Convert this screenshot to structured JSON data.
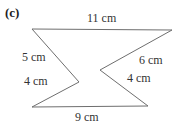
{
  "figure": {
    "part_label": "(c)",
    "shape_name": "zigzag-hexagon",
    "stroke_color": "#6e6e6e",
    "fill_color": "#ffffff",
    "background_color": "#ffffff",
    "vertices": [
      {
        "name": "top-left",
        "x": 32,
        "y": 29
      },
      {
        "name": "top-right",
        "x": 172,
        "y": 30
      },
      {
        "name": "right-notch",
        "x": 100,
        "y": 70
      },
      {
        "name": "bottom-right",
        "x": 148,
        "y": 106
      },
      {
        "name": "bottom-left",
        "x": 32,
        "y": 107
      },
      {
        "name": "left-notch",
        "x": 79,
        "y": 82
      }
    ],
    "labels": {
      "top": "11 cm",
      "bottom": "9 cm",
      "left_upper": "5 cm",
      "left_lower": "4 cm",
      "right_upper": "6 cm",
      "right_lower": "4 cm"
    }
  }
}
